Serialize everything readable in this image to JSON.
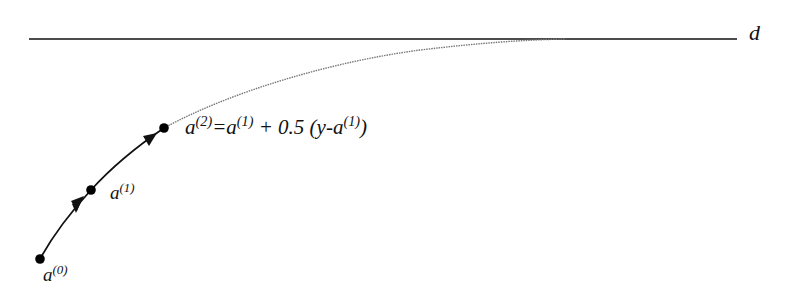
{
  "diagram": {
    "title": "",
    "colors": {
      "line": "#111111",
      "curve": "#777777",
      "point": "#000000",
      "background": "#ffffff"
    },
    "target_line": {
      "label": "d",
      "x1": 29,
      "y1": 39,
      "x2": 737,
      "y2": 39
    },
    "points": [
      {
        "id": "a0",
        "base": "a",
        "superscript": "(0)",
        "x": 40,
        "y": 259
      },
      {
        "id": "a1",
        "base": "a",
        "superscript": "(1)",
        "x": 91,
        "y": 190
      },
      {
        "id": "a2",
        "base": "a",
        "superscript": "(2)",
        "x": 164,
        "y": 128
      }
    ],
    "arrows": [
      {
        "from": "a0",
        "to": "a1"
      },
      {
        "from": "a1",
        "to": "a2"
      }
    ],
    "curve": {
      "description": "dotted asymptotic trajectory from a(2) approaching line d",
      "start": [
        164,
        128
      ],
      "end": [
        560,
        39
      ]
    },
    "labels": {
      "a0": {
        "base": "a",
        "sup": "(0)"
      },
      "a1": {
        "base": "a",
        "sup": "(1)"
      },
      "update_rule": {
        "lhs_base": "a",
        "lhs_sup": "(2)",
        "eq": "=",
        "t1_base": "a",
        "t1_sup": "(1)",
        "plus": " + 0.5 (y-",
        "t2_base": "a",
        "t2_sup": "(1)",
        "close": ")"
      },
      "d": "d"
    }
  }
}
